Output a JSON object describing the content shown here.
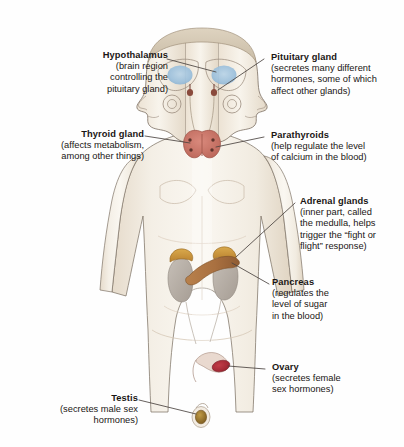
{
  "diagram": {
    "background_color": "#fefefe",
    "text_color": "#1a1614",
    "leader_line_color": "#4a4340",
    "palette": {
      "skin": "#f2ece2",
      "skin_shadow": "#e3d8c8",
      "outline": "#6d6258",
      "brain_blue": "#9fc2dd",
      "thyroid_red": "#c8766a",
      "parathyroid_dot": "#6a3b33",
      "adrenal_gold": "#c9973f",
      "kidney_gray": "#b9b2ab",
      "pancreas_brown": "#a9713f",
      "ovary_red": "#b02e3a",
      "testis_gold": "#a07a33"
    },
    "labels": [
      {
        "id": "hypothalamus",
        "side": "left",
        "heading": "Hypothalamus",
        "description": "(brain region controlling the pituitary gland)",
        "lines": [
          "(brain region",
          "controlling the",
          "pituitary gland)"
        ]
      },
      {
        "id": "thyroid-gland",
        "side": "left",
        "heading": "Thyroid gland",
        "description": "(affects metabolism, among other things)",
        "lines": [
          "(affects metabolism,",
          "among other things)"
        ]
      },
      {
        "id": "testis",
        "side": "left",
        "heading": "Testis",
        "description": "(secretes male sex hormones)",
        "lines": [
          "(secretes male sex",
          "hormones)"
        ]
      },
      {
        "id": "pituitary-gland",
        "side": "right",
        "heading": "Pituitary gland",
        "description": "(secretes many different hormones, some of which affect other glands)",
        "lines": [
          "(secretes many different",
          "hormones, some of which",
          "affect other glands)"
        ]
      },
      {
        "id": "parathyroids",
        "side": "right",
        "heading": "Parathyroids",
        "description": "(help regulate the level of calcium in the blood)",
        "lines": [
          "(help regulate the level",
          "of calcium in the blood)"
        ]
      },
      {
        "id": "adrenal-glands",
        "side": "right",
        "heading": "Adrenal glands",
        "description": "(inner part, called the medulla, helps trigger the “fight or flight” response)",
        "lines": [
          "(inner part, called",
          "the medulla, helps",
          "trigger the “fight or",
          "flight” response)"
        ]
      },
      {
        "id": "pancreas",
        "side": "right",
        "heading": "Pancreas",
        "description": "(regulates the level of sugar in the blood)",
        "lines": [
          "(regulates the",
          "level of sugar",
          "in the blood)"
        ]
      },
      {
        "id": "ovary",
        "side": "right",
        "heading": "Ovary",
        "description": "(secretes female sex hormones)",
        "lines": [
          "(secretes female",
          "sex hormones)"
        ]
      }
    ]
  }
}
